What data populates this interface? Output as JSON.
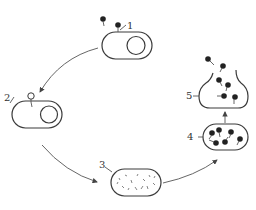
{
  "diagram": {
    "type": "cycle",
    "stages": [
      {
        "id": 1,
        "label": "1",
        "description": "phage adsorption onto bacterial cell"
      },
      {
        "id": 2,
        "label": "2",
        "description": "phage injects nucleic acid into cell"
      },
      {
        "id": 3,
        "label": "3",
        "description": "biosynthesis of phage components inside cell"
      },
      {
        "id": 4,
        "label": "4",
        "description": "assembly of new phage particles"
      },
      {
        "id": 5,
        "label": "5",
        "description": "cell lysis and release of phages"
      }
    ],
    "edges": [
      {
        "from": 1,
        "to": 2
      },
      {
        "from": 2,
        "to": 3
      },
      {
        "from": 3,
        "to": 4
      },
      {
        "from": 4,
        "to": 5
      }
    ],
    "colors": {
      "line": "#3a3a3a",
      "phage": "#222222",
      "background": "#ffffff"
    }
  }
}
